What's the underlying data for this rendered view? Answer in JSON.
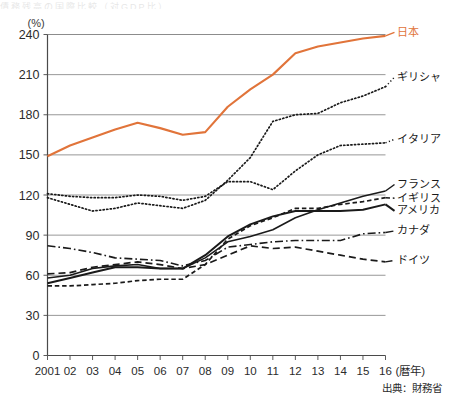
{
  "figure": {
    "y_unit_label": "(%)",
    "x_axis_label": "(暦年)",
    "source_text": "出典：財務省",
    "clipped_header": "債務残高の国際比較（対GDP比）",
    "accent_color": "#e1743a",
    "line_color": "#1a1a1a",
    "grid_color": "#8c8c8c",
    "axis_color": "#4a4a4a"
  },
  "chart_data": {
    "type": "line",
    "title": "",
    "xlabel": "(暦年)",
    "ylabel": "(%)",
    "ylim": [
      0,
      240
    ],
    "yticks": [
      0,
      30,
      60,
      90,
      120,
      150,
      180,
      210,
      240
    ],
    "grid": true,
    "legend_position": "right-of-plot",
    "x": [
      2001,
      2002,
      2003,
      2004,
      2005,
      2006,
      2007,
      2008,
      2009,
      2010,
      2011,
      2012,
      2013,
      2014,
      2015,
      2016
    ],
    "categories": [
      "2001",
      "02",
      "03",
      "04",
      "05",
      "06",
      "07",
      "08",
      "09",
      "10",
      "11",
      "12",
      "13",
      "14",
      "15",
      "16"
    ],
    "series": [
      {
        "name": "日本",
        "label": "日本",
        "color": "#e1743a",
        "style": "solid",
        "width": 2.1,
        "values": [
          149,
          157,
          163,
          169,
          174,
          170,
          165,
          167,
          186,
          199,
          210,
          226,
          231,
          234,
          237,
          239
        ]
      },
      {
        "name": "ギリシャ",
        "label": "ギリシャ",
        "color": "#1a1a1a",
        "style": "dotted",
        "width": 1.7,
        "values": [
          118,
          113,
          108,
          110,
          114,
          112,
          110,
          116,
          131,
          148,
          175,
          180,
          181,
          189,
          194,
          201
        ]
      },
      {
        "name": "イタリア",
        "label": "イタリア",
        "color": "#1a1a1a",
        "style": "dotted",
        "width": 1.7,
        "values": [
          121,
          119,
          118,
          118,
          120,
          119,
          116,
          119,
          130,
          130,
          124,
          138,
          150,
          157,
          158,
          159
        ]
      },
      {
        "name": "フランス",
        "label": "フランス",
        "color": "#1a1a1a",
        "style": "solid",
        "width": 1.6,
        "values": [
          58,
          60,
          65,
          67,
          68,
          65,
          65,
          73,
          85,
          89,
          94,
          103,
          109,
          114,
          119,
          123
        ]
      },
      {
        "name": "イギリス",
        "label": "イギリス",
        "color": "#1a1a1a",
        "style": "dashed-fine",
        "width": 1.7,
        "values": [
          52,
          52,
          53,
          54,
          56,
          57,
          57,
          68,
          87,
          97,
          103,
          110,
          110,
          113,
          115,
          118
        ]
      },
      {
        "name": "アメリカ",
        "label": "アメリカ",
        "color": "#1a1a1a",
        "style": "solid-heavy",
        "width": 2.0,
        "values": [
          54,
          58,
          62,
          66,
          66,
          65,
          65,
          75,
          89,
          98,
          104,
          108,
          108,
          108,
          109,
          113
        ]
      },
      {
        "name": "カナダ",
        "label": "カナダ",
        "color": "#1a1a1a",
        "style": "dash-dot",
        "width": 1.6,
        "values": [
          82,
          80,
          77,
          73,
          72,
          71,
          67,
          71,
          81,
          83,
          85,
          86,
          86,
          86,
          91,
          92
        ]
      },
      {
        "name": "ドイツ",
        "label": "ドイツ",
        "color": "#1a1a1a",
        "style": "dashed",
        "width": 1.7,
        "values": [
          61,
          62,
          66,
          68,
          70,
          68,
          65,
          68,
          75,
          82,
          80,
          81,
          78,
          75,
          72,
          70
        ]
      }
    ]
  },
  "legend": [
    {
      "label": "日本",
      "style": "solid",
      "color": "#e1743a"
    },
    {
      "label": "ギリシャ",
      "style": "dotted",
      "color": "#1a1a1a"
    },
    {
      "label": "イタリア",
      "style": "dotted",
      "color": "#1a1a1a"
    },
    {
      "label": "フランス",
      "style": "solid",
      "color": "#1a1a1a"
    },
    {
      "label": "イギリス",
      "style": "dashed-fine",
      "color": "#1a1a1a"
    },
    {
      "label": "アメリカ",
      "style": "solid-heavy",
      "color": "#1a1a1a"
    },
    {
      "label": "カナダ",
      "style": "dash-dot",
      "color": "#1a1a1a"
    },
    {
      "label": "ドイツ",
      "style": "dashed",
      "color": "#1a1a1a"
    }
  ]
}
